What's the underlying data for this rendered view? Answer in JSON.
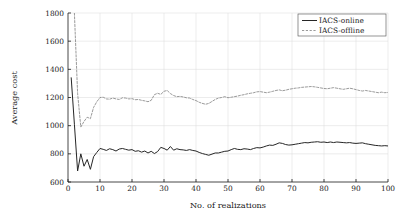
{
  "chart_data": {
    "type": "line",
    "title": "",
    "xlabel": "No. of realizations",
    "ylabel": "Average cost",
    "xlim": [
      0,
      100
    ],
    "ylim": [
      600,
      1800
    ],
    "xticks": [
      0,
      10,
      20,
      30,
      40,
      50,
      60,
      70,
      80,
      90,
      100
    ],
    "yticks": [
      600,
      800,
      1000,
      1200,
      1400,
      1600,
      1800
    ],
    "xtick_labels": [
      "0",
      "10",
      "20",
      "30",
      "40",
      "50",
      "60",
      "70",
      "80",
      "90",
      "100"
    ],
    "ytick_labels": [
      "600",
      "800",
      "1000",
      "1200",
      "1400",
      "1600",
      "1800"
    ],
    "grid": true,
    "legend_position": "top-right",
    "series": [
      {
        "name": "IACS-online",
        "style": "solid",
        "color": "#262626",
        "x": [
          1,
          2,
          3,
          4,
          5,
          6,
          7,
          8,
          9,
          10,
          11,
          12,
          13,
          14,
          15,
          16,
          17,
          18,
          19,
          20,
          21,
          22,
          23,
          24,
          25,
          26,
          27,
          28,
          29,
          30,
          31,
          32,
          33,
          34,
          35,
          36,
          37,
          38,
          39,
          40,
          41,
          42,
          43,
          44,
          45,
          46,
          47,
          48,
          49,
          50,
          51,
          52,
          53,
          54,
          55,
          56,
          57,
          58,
          59,
          60,
          61,
          62,
          63,
          64,
          65,
          66,
          67,
          68,
          69,
          70,
          71,
          72,
          73,
          74,
          75,
          76,
          77,
          78,
          79,
          80,
          81,
          82,
          83,
          84,
          85,
          86,
          87,
          88,
          89,
          90,
          91,
          92,
          93,
          94,
          95,
          96,
          97,
          98,
          99,
          100
        ],
        "values": [
          1340,
          1010,
          678,
          800,
          712,
          760,
          690,
          780,
          810,
          838,
          832,
          824,
          836,
          830,
          820,
          834,
          838,
          832,
          826,
          830,
          818,
          822,
          812,
          820,
          806,
          818,
          802,
          816,
          846,
          838,
          826,
          852,
          826,
          836,
          830,
          828,
          824,
          830,
          824,
          820,
          810,
          802,
          796,
          790,
          798,
          806,
          806,
          812,
          818,
          820,
          830,
          838,
          832,
          830,
          836,
          834,
          830,
          838,
          844,
          842,
          848,
          856,
          862,
          860,
          868,
          878,
          874,
          866,
          862,
          864,
          868,
          872,
          876,
          880,
          878,
          882,
          884,
          886,
          882,
          884,
          880,
          884,
          880,
          884,
          882,
          880,
          878,
          880,
          876,
          874,
          876,
          878,
          872,
          868,
          864,
          860,
          858,
          856,
          858,
          856
        ]
      },
      {
        "name": "IACS-offline",
        "style": "dashed",
        "color": "#808080",
        "x": [
          1,
          2,
          3,
          4,
          5,
          6,
          7,
          8,
          9,
          10,
          11,
          12,
          13,
          14,
          15,
          16,
          17,
          18,
          19,
          20,
          21,
          22,
          23,
          24,
          25,
          26,
          27,
          28,
          29,
          30,
          31,
          32,
          33,
          34,
          35,
          36,
          37,
          38,
          39,
          40,
          41,
          42,
          43,
          44,
          45,
          46,
          47,
          48,
          49,
          50,
          51,
          52,
          53,
          54,
          55,
          56,
          57,
          58,
          59,
          60,
          61,
          62,
          63,
          64,
          65,
          66,
          67,
          68,
          69,
          70,
          71,
          72,
          73,
          74,
          75,
          76,
          77,
          78,
          79,
          80,
          81,
          82,
          83,
          84,
          85,
          86,
          87,
          88,
          89,
          90,
          91,
          92,
          93,
          94,
          95,
          96,
          97,
          98,
          99,
          100
        ],
        "values": [
          2150,
          1800,
          1230,
          990,
          1030,
          1060,
          1050,
          1130,
          1170,
          1200,
          1202,
          1190,
          1188,
          1196,
          1190,
          1186,
          1198,
          1196,
          1190,
          1192,
          1184,
          1186,
          1180,
          1176,
          1170,
          1180,
          1220,
          1230,
          1222,
          1244,
          1250,
          1228,
          1214,
          1206,
          1208,
          1204,
          1198,
          1196,
          1186,
          1178,
          1166,
          1158,
          1152,
          1158,
          1172,
          1186,
          1196,
          1200,
          1206,
          1198,
          1202,
          1206,
          1210,
          1216,
          1220,
          1226,
          1230,
          1234,
          1240,
          1242,
          1238,
          1234,
          1238,
          1244,
          1250,
          1254,
          1248,
          1252,
          1258,
          1262,
          1266,
          1268,
          1272,
          1274,
          1276,
          1278,
          1276,
          1272,
          1268,
          1264,
          1262,
          1266,
          1270,
          1266,
          1262,
          1258,
          1262,
          1266,
          1262,
          1256,
          1250,
          1246,
          1250,
          1246,
          1242,
          1238,
          1234,
          1238,
          1234,
          1236
        ]
      }
    ]
  },
  "legend": {
    "items": [
      {
        "label": "IACS-online"
      },
      {
        "label": "IACS-offline"
      }
    ]
  }
}
